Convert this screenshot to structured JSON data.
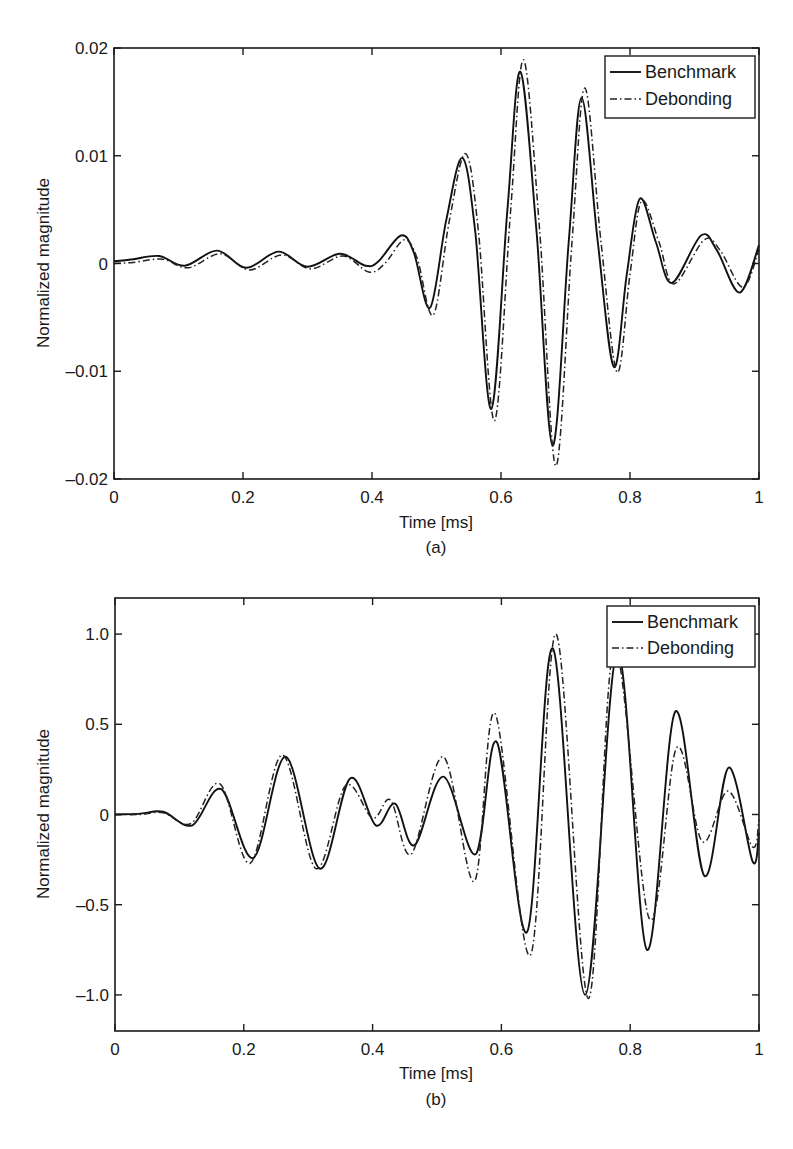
{
  "chart_data": [
    {
      "id": "a",
      "type": "line",
      "caption": "(a)",
      "xlabel": "Time [ms]",
      "ylabel": "Normalized magnitude",
      "xlim": [
        0,
        1
      ],
      "ylim": [
        -0.02,
        0.02
      ],
      "xticks": [
        "0",
        "0.2",
        "0.4",
        "0.6",
        "0.8",
        "1"
      ],
      "xtick_values": [
        0,
        0.2,
        0.4,
        0.6,
        0.8,
        1
      ],
      "yticks": [
        "-0.02",
        "-0.01",
        "0",
        "0.01",
        "0.02"
      ],
      "ytick_values": [
        -0.02,
        -0.01,
        0,
        0.01,
        0.02
      ],
      "grid": false,
      "legend": {
        "position": "upper right",
        "entries": [
          "Benchmark",
          "Debonding"
        ]
      },
      "series": [
        {
          "name": "Benchmark",
          "style": "solid",
          "x": [
            0,
            0.03,
            0.07,
            0.11,
            0.16,
            0.205,
            0.255,
            0.3,
            0.35,
            0.39,
            0.41,
            0.445,
            0.465,
            0.49,
            0.515,
            0.54,
            0.56,
            0.585,
            0.61,
            0.63,
            0.655,
            0.68,
            0.705,
            0.725,
            0.75,
            0.775,
            0.795,
            0.815,
            0.84,
            0.865,
            0.91,
            0.935,
            0.97,
            1.0
          ],
          "values": [
            0.0002,
            0.0004,
            0.0007,
            -0.0002,
            0.0012,
            -0.0004,
            0.0011,
            -0.0003,
            0.0009,
            -0.0002,
            0.0002,
            0.0026,
            0.001,
            -0.0041,
            0.004,
            0.0098,
            0.003,
            -0.0135,
            0.005,
            0.0178,
            0.003,
            -0.0169,
            0.002,
            0.0154,
            0.002,
            -0.0096,
            -0.001,
            0.006,
            0.002,
            -0.0018,
            0.0026,
            0.0012,
            -0.0027,
            0.0017
          ]
        },
        {
          "name": "Debonding",
          "style": "dash-dot",
          "x": [
            0,
            0.03,
            0.075,
            0.115,
            0.165,
            0.21,
            0.26,
            0.305,
            0.355,
            0.395,
            0.42,
            0.45,
            0.47,
            0.495,
            0.52,
            0.545,
            0.565,
            0.59,
            0.615,
            0.635,
            0.66,
            0.685,
            0.71,
            0.73,
            0.755,
            0.78,
            0.8,
            0.818,
            0.845,
            0.868,
            0.915,
            0.94,
            0.975,
            1.0
          ],
          "values": [
            0.0,
            0.0001,
            0.0004,
            -0.0004,
            0.0009,
            -0.0006,
            0.0008,
            -0.0005,
            0.0007,
            -0.0008,
            0.0,
            0.0022,
            0.0005,
            -0.0048,
            0.004,
            0.0102,
            0.003,
            -0.0146,
            0.005,
            0.0189,
            0.003,
            -0.0188,
            0.002,
            0.0163,
            0.002,
            -0.0101,
            -0.001,
            0.0058,
            0.002,
            -0.0019,
            0.0022,
            0.0012,
            -0.0022,
            0.0013
          ]
        }
      ]
    },
    {
      "id": "b",
      "type": "line",
      "caption": "(b)",
      "xlabel": "Time [ms]",
      "ylabel": "Normalized magnitude",
      "xlim": [
        0,
        1
      ],
      "ylim": [
        -1.2,
        1.2
      ],
      "xticks": [
        "0",
        "0.2",
        "0.4",
        "0.6",
        "0.8",
        "1"
      ],
      "xtick_values": [
        0,
        0.2,
        0.4,
        0.6,
        0.8,
        1
      ],
      "yticks": [
        "-1.0",
        "-0.5",
        "0",
        "0.5",
        "1.0"
      ],
      "ytick_values": [
        -1.0,
        -0.5,
        0,
        0.5,
        1.0
      ],
      "grid": false,
      "legend": {
        "position": "upper right",
        "entries": [
          "Benchmark",
          "Debonding"
        ]
      },
      "series": [
        {
          "name": "Benchmark",
          "style": "solid",
          "x": [
            0,
            0.04,
            0.075,
            0.12,
            0.165,
            0.215,
            0.265,
            0.318,
            0.365,
            0.405,
            0.435,
            0.465,
            0.51,
            0.56,
            0.593,
            0.64,
            0.68,
            0.73,
            0.78,
            0.826,
            0.87,
            0.915,
            0.953,
            0.99,
            1.0
          ],
          "values": [
            0.0,
            0.005,
            0.015,
            -0.06,
            0.14,
            -0.24,
            0.32,
            -0.3,
            0.2,
            -0.06,
            0.06,
            -0.17,
            0.21,
            -0.22,
            0.4,
            -0.65,
            0.92,
            -1.0,
            0.9,
            -0.75,
            0.57,
            -0.34,
            0.26,
            -0.26,
            -0.1
          ]
        },
        {
          "name": "Debonding",
          "style": "dash-dot",
          "x": [
            0,
            0.04,
            0.075,
            0.118,
            0.163,
            0.21,
            0.26,
            0.312,
            0.358,
            0.4,
            0.428,
            0.46,
            0.51,
            0.558,
            0.59,
            0.645,
            0.685,
            0.735,
            0.775,
            0.83,
            0.872,
            0.912,
            0.952,
            0.99,
            1.0
          ],
          "values": [
            0.0,
            0.0,
            0.01,
            -0.05,
            0.17,
            -0.27,
            0.33,
            -0.3,
            0.16,
            -0.02,
            0.08,
            -0.22,
            0.32,
            -0.37,
            0.56,
            -0.78,
            1.0,
            -1.02,
            0.92,
            -0.58,
            0.37,
            -0.15,
            0.13,
            -0.18,
            -0.03
          ]
        }
      ]
    }
  ]
}
